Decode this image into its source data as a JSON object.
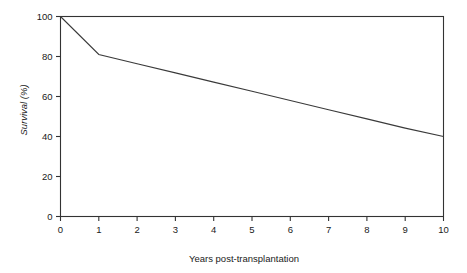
{
  "chart_data": {
    "type": "line",
    "title": "",
    "subtitle": "",
    "xlabel": "Years post-transplantation",
    "ylabel": "Survival (%)",
    "xlim": [
      0,
      10
    ],
    "ylim": [
      0,
      100
    ],
    "xticks": [
      0,
      1,
      2,
      3,
      4,
      5,
      6,
      7,
      8,
      9,
      10
    ],
    "xtick_labels": [
      "0",
      "1",
      "2",
      "3",
      "4",
      "5",
      "6",
      "7",
      "8",
      "9",
      "10"
    ],
    "yticks": [
      0,
      20,
      40,
      60,
      80,
      100
    ],
    "ytick_labels": [
      "0",
      "20",
      "40",
      "60",
      "80",
      "100"
    ],
    "grid": false,
    "legend": false,
    "legend_position": "none",
    "frame": "box",
    "tick_direction": "out",
    "series": [
      {
        "name": "Survival",
        "color": "#3a3a3a",
        "x": [
          0,
          1,
          2,
          3,
          4,
          5,
          6,
          7,
          8,
          9,
          10
        ],
        "values": [
          100,
          81,
          76.4,
          71.8,
          67.2,
          62.6,
          58.0,
          53.4,
          48.8,
          44.2,
          40
        ]
      }
    ],
    "annotations": []
  },
  "figure": {
    "background_color": "#ffffff",
    "line_color": "#3a3a3a",
    "text_color": "#1a1a1a"
  }
}
